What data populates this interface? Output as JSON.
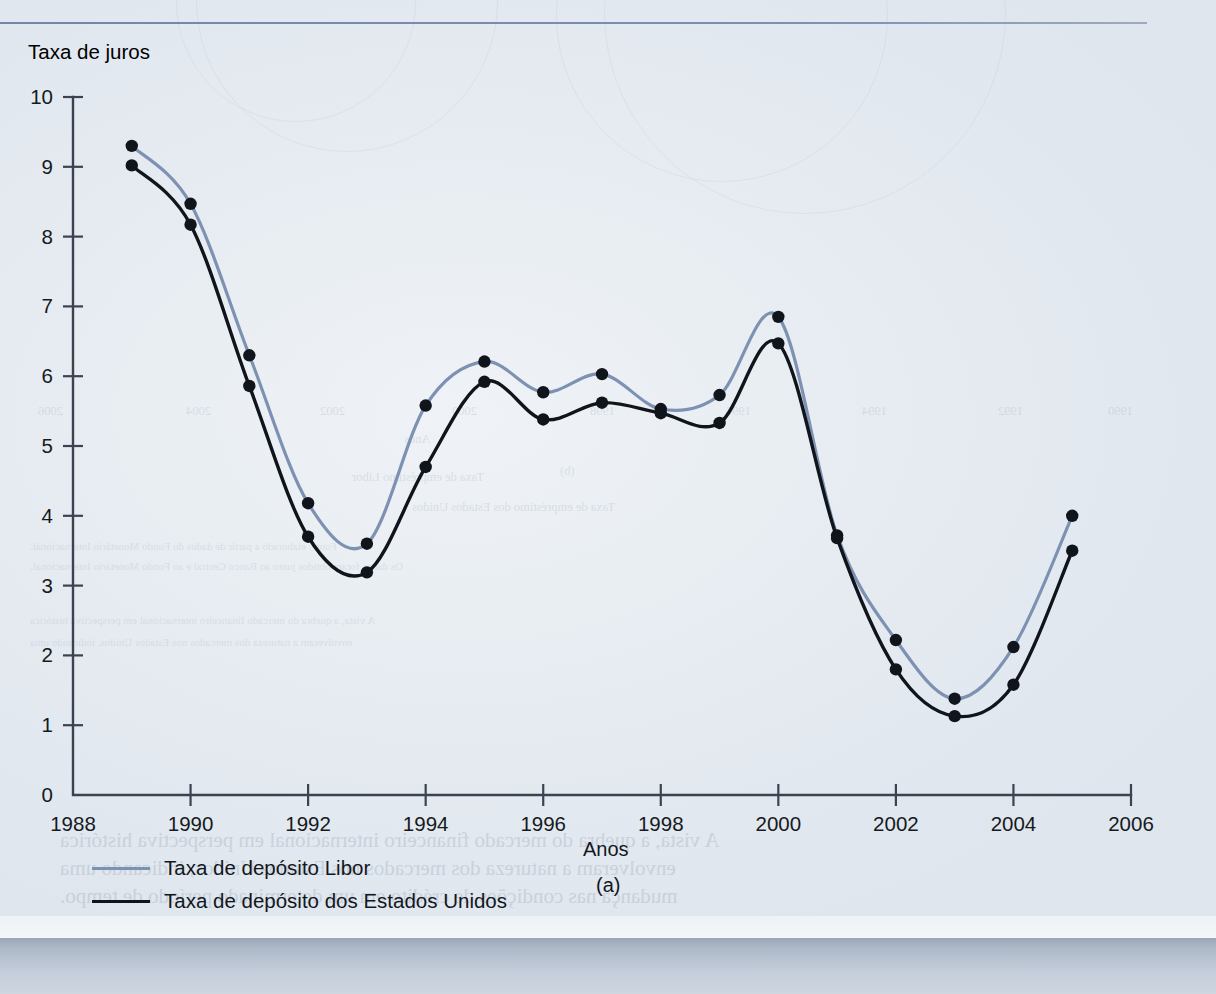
{
  "figure": {
    "y_axis_title": "Taxa de juros",
    "x_axis_title": "Anos",
    "caption": "(a)"
  },
  "legend": {
    "items": [
      {
        "label": "Taxa de depósito Libor",
        "color": "#7d91b2"
      },
      {
        "label": "Taxa de depósito dos Estados Unidos",
        "color": "#10141b"
      }
    ]
  },
  "colors": {
    "libor": "#7d91b2",
    "united_states": "#10141b",
    "axis": "#3b4350",
    "page_background": "#e8edf2",
    "top_rule": "#6f7fa4",
    "footer_band": "#aeb9c9"
  },
  "ghost_text": {
    "lines": [
      "1988",
      "1990",
      "1992",
      "1994",
      "1996",
      "1998",
      "2000",
      "2002",
      "2004",
      "2006",
      "Anos",
      "(b)",
      "Taxa de empréstimo Libor",
      "Taxa de empréstimo dos Estados Unidos",
      "Fonte: elaborado a partir de dados do Fundo Monetário Internacional.",
      "Os dados foram obtidos junto ao Banco Central e ao Fundo Monetário Internacional.",
      "A vista, a quebra do mercado financeiro internacional em perspectiva histórica",
      "envolveram a natureza dos mercados nos Estados Unidos, indicando uma",
      "mudança nas condições de crédito em um determinado período de tempo.",
      "Isso possibilita a similaridade ao desenho do Gráfico 10.6 com que já apresenta os mercados envolvidos."
    ]
  },
  "chart_data": {
    "type": "line",
    "title": "",
    "xlabel": "Anos",
    "ylabel": "Taxa de juros",
    "xlim": [
      1988,
      2006
    ],
    "ylim": [
      0,
      10
    ],
    "xticks": [
      1988,
      1990,
      1992,
      1994,
      1996,
      1998,
      2000,
      2002,
      2004,
      2006
    ],
    "yticks": [
      0,
      1,
      2,
      3,
      4,
      5,
      6,
      7,
      8,
      9,
      10
    ],
    "grid": false,
    "legend_position": "below-left",
    "smoothing": "spline",
    "x": [
      1989,
      1990,
      1991,
      1992,
      1993,
      1994,
      1995,
      1996,
      1997,
      1998,
      1999,
      2000,
      2001,
      2002,
      2003,
      2004,
      2005
    ],
    "series": [
      {
        "name": "Taxa de depósito Libor",
        "color": "#7d91b2",
        "values": [
          9.3,
          8.47,
          6.3,
          4.18,
          3.6,
          5.58,
          6.21,
          5.77,
          6.03,
          5.53,
          5.73,
          6.85,
          3.72,
          2.22,
          1.38,
          2.12,
          4.0
        ]
      },
      {
        "name": "Taxa de depósito dos Estados Unidos",
        "color": "#10141b",
        "values": [
          9.02,
          8.17,
          5.86,
          3.7,
          3.19,
          4.7,
          5.92,
          5.38,
          5.62,
          5.47,
          5.33,
          6.47,
          3.68,
          1.8,
          1.13,
          1.58,
          3.5
        ]
      }
    ]
  }
}
